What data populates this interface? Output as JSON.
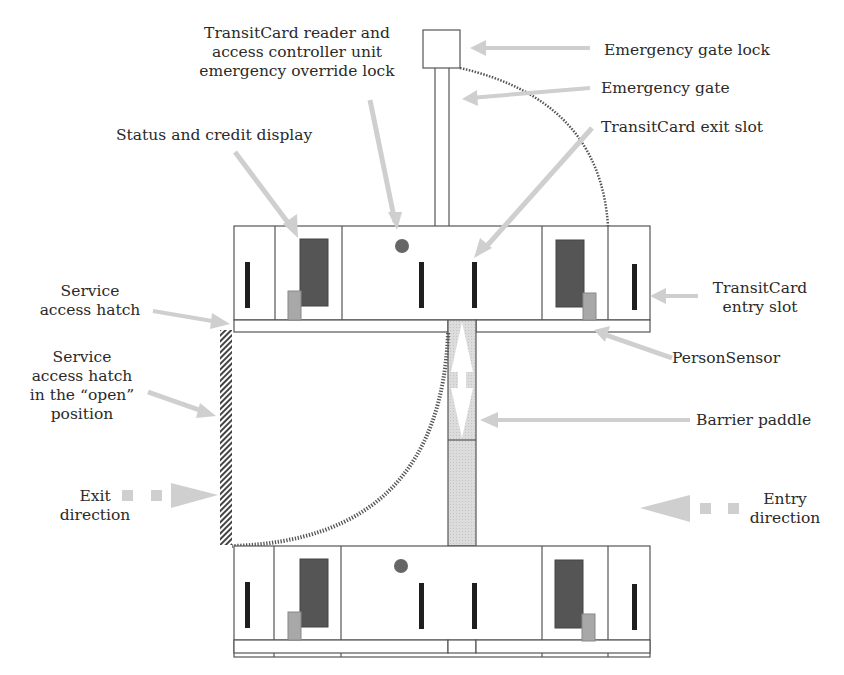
{
  "labels": {
    "reader_lock": [
      "TransitCard reader and",
      "access controller unit",
      "emergency override lock"
    ],
    "gate_lock": "Emergency gate lock",
    "gate": "Emergency gate",
    "exit_slot": "TransitCard exit slot",
    "display": "Status and credit display",
    "hatch": [
      "Service",
      "access hatch"
    ],
    "hatch_open": [
      "Service",
      "access hatch",
      "in the “open”",
      "position"
    ],
    "exit_dir": [
      "Exit",
      "direction"
    ],
    "entry_slot": [
      "TransitCard",
      "entry slot"
    ],
    "person_sensor": "PersonSensor",
    "paddle": "Barrier paddle",
    "entry_dir": [
      "Entry",
      "direction"
    ]
  },
  "colors": {
    "line": "#555555",
    "display": "#555555",
    "sensor": "#a8a8a8",
    "slot": "#1e1e1e",
    "lock_dot": "#666666",
    "arrow": "#cfcfcf",
    "paddle_fill": "#d8d8d8"
  }
}
